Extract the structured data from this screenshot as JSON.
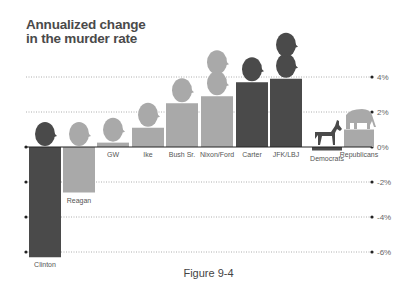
{
  "title_line1": "Annualized change",
  "title_line2": "in the murder rate",
  "caption": "Figure 9-4",
  "colors": {
    "democrat": "#4a4a4a",
    "republican": "#a9a9a9",
    "axis": "#222222",
    "grid": "#999999"
  },
  "chart_data": {
    "type": "bar",
    "title": "Annualized change in the murder rate",
    "xlabel": "",
    "ylabel": "",
    "ylim": [
      -6.5,
      4.5
    ],
    "yticks": [
      "4%",
      "2%",
      "0%",
      "-2%",
      "-4%",
      "-6%"
    ],
    "grid": true,
    "categories": [
      "Clinton",
      "Reagan",
      "GW",
      "Ike",
      "Bush Sr.",
      "Nixon/Ford",
      "Carter",
      "JFK/LBJ",
      "Democrats",
      "Republicans"
    ],
    "values": [
      -6.3,
      -2.6,
      0.25,
      1.1,
      2.5,
      2.9,
      3.7,
      3.9,
      -0.2,
      1.0
    ],
    "party": [
      "D",
      "R",
      "R",
      "R",
      "R",
      "R",
      "D",
      "D",
      "D",
      "R"
    ],
    "annotations": [
      "President head silhouettes above each bar",
      "Donkey above Democrats bar",
      "Elephant above Republicans bar"
    ]
  }
}
